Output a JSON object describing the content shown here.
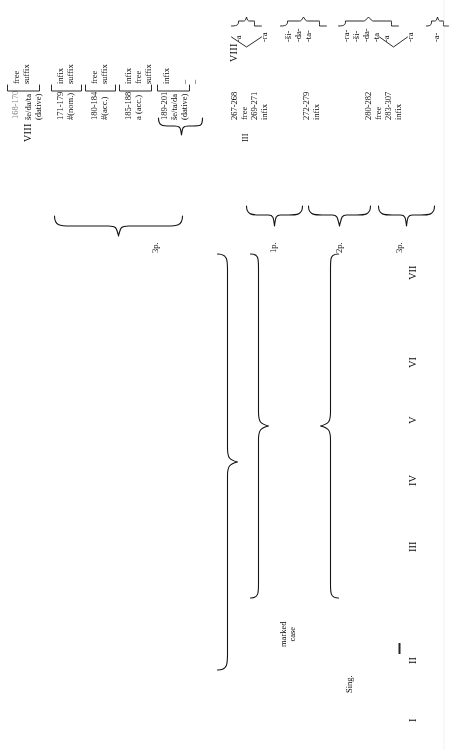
{
  "page": {
    "kind": "linguistic-paradigm-table",
    "orientation": "rotated-90-ccw",
    "ink_color": "#141414"
  },
  "column_headers": [
    {
      "id": "c1",
      "label": "I"
    },
    {
      "id": "c2",
      "label": "II"
    },
    {
      "id": "c3",
      "label": "III"
    },
    {
      "id": "c4",
      "label": "IV"
    },
    {
      "id": "c5",
      "label": "V"
    },
    {
      "id": "c6",
      "label": "VI"
    },
    {
      "id": "c7",
      "label": "VII"
    }
  ],
  "row_labels": [
    {
      "id": "r1",
      "label": "3p."
    },
    {
      "id": "r2",
      "label": "1p."
    },
    {
      "id": "r3",
      "label": "2p."
    },
    {
      "id": "r4",
      "label": "3p."
    }
  ],
  "group_labels": [
    {
      "id": "g-marked",
      "line1": "marked",
      "line2": "case"
    },
    {
      "id": "g-sing",
      "line1": "Sing."
    }
  ],
  "col8_heading": "VIII",
  "col8_entries": [
    {
      "id": "e0",
      "ref": "168-170",
      "form": "",
      "gloss": "",
      "kind1": "free",
      "kind2": "suffix"
    },
    {
      "id": "e1",
      "ref": "",
      "form": "še/da/ta",
      "gloss": "(dative)",
      "kind1": "",
      "kind2": ""
    },
    {
      "id": "e2",
      "ref": "171-179",
      "form": "#(nom.)",
      "gloss": "",
      "kind1": "infix",
      "kind2": "suffix"
    },
    {
      "id": "e3",
      "ref": "180-184",
      "form": "#(acc.)",
      "gloss": "",
      "kind1": "free",
      "kind2": "suffix"
    },
    {
      "id": "e4",
      "ref": "185-188",
      "form": "a (acc.)",
      "gloss": "",
      "kind1": "infix",
      "kind2": "free"
    },
    {
      "id": "e5",
      "ref": "189-201",
      "form": "še/ta/da",
      "gloss": "(dative)",
      "kind1": "suffix",
      "kind2": "infix"
    }
  ],
  "col8_block_left": {
    "line_ref": "168-170",
    "lines": [
      "free",
      "suffix",
      "infix",
      "free",
      "suffix",
      "infix",
      "free",
      "suffix",
      "infix",
      "free",
      "suffix"
    ]
  },
  "colIII_block": {
    "heading": "III",
    "lines": [
      "267-268",
      "free",
      "269-271",
      "infix"
    ]
  },
  "colIII_block2": {
    "lines": [
      "272-279",
      "infix"
    ]
  },
  "colIII_block3": {
    "lines": [
      "280-282",
      "free",
      "283-307",
      "infix"
    ]
  },
  "colVIII_right": {
    "heading": "VIII",
    "entries": [
      {
        "id": "p1",
        "forms": [
          "-a",
          "-ra"
        ]
      },
      {
        "id": "p2",
        "forms": [
          "-ši-",
          "-da-",
          "-ta-"
        ]
      },
      {
        "id": "p3",
        "forms": [
          "-ra-",
          "-ši-",
          "-da-",
          "-ta"
        ]
      },
      {
        "id": "p4",
        "forms": [
          "-a",
          "-ra"
        ]
      },
      {
        "id": "p5",
        "forms": [
          "-a-"
        ]
      }
    ]
  },
  "infix_dashes": [
    "infix",
    "–",
    "–"
  ],
  "misc": {
    "infix_word": "infix",
    "free_word": "free",
    "suffix_word": "suffix",
    "dash": "–"
  }
}
